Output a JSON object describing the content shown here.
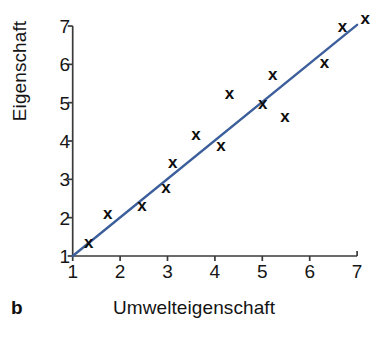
{
  "panel": {
    "letter": "b"
  },
  "chart_data": {
    "type": "scatter",
    "title": "",
    "xlabel": "Umwelteigenschaft",
    "ylabel": "Eigenschaft",
    "xlim": [
      1,
      7
    ],
    "ylim": [
      1,
      7
    ],
    "xticks": [
      1,
      2,
      3,
      4,
      5,
      6,
      7
    ],
    "yticks": [
      1,
      2,
      3,
      4,
      5,
      6,
      7
    ],
    "xticklabels": [
      "1",
      "2",
      "3",
      "4",
      "5",
      "6",
      "7"
    ],
    "yticklabels": [
      "1",
      "2",
      "3",
      "4",
      "5",
      "6",
      "7"
    ],
    "grid": false,
    "legend": false,
    "marker": "x",
    "marker_color": "#0d0d0d",
    "line_color": "#3c5f9c",
    "points": [
      {
        "x": 1.34,
        "y": 1.34
      },
      {
        "x": 1.74,
        "y": 2.12
      },
      {
        "x": 2.46,
        "y": 2.33
      },
      {
        "x": 2.97,
        "y": 2.8
      },
      {
        "x": 3.11,
        "y": 3.45
      },
      {
        "x": 3.6,
        "y": 4.18
      },
      {
        "x": 4.13,
        "y": 3.87
      },
      {
        "x": 4.31,
        "y": 5.23
      },
      {
        "x": 5.01,
        "y": 4.99
      },
      {
        "x": 5.22,
        "y": 5.74
      },
      {
        "x": 5.48,
        "y": 4.63
      },
      {
        "x": 6.31,
        "y": 6.04
      },
      {
        "x": 6.69,
        "y": 7.0
      },
      {
        "x": 7.17,
        "y": 7.19
      }
    ],
    "trendline": {
      "type": "line",
      "x": [
        1.0,
        7.0
      ],
      "y": [
        1.0,
        7.03
      ],
      "color": "#3c5f9c",
      "width": 2.4
    },
    "axis_color": "#3a3a3a"
  }
}
